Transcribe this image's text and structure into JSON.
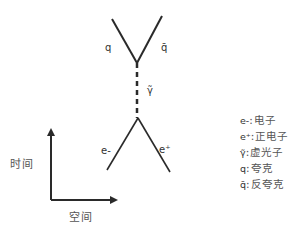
{
  "diagram": {
    "title": "",
    "particles": {
      "quark": "q",
      "antiquark": "q̄",
      "virtual_photon": "γ̃",
      "electron": "e-",
      "positron": "e⁺"
    },
    "axes": {
      "time_label": "时间",
      "space_label": "空间"
    },
    "legend": [
      {
        "symbol": "e-",
        "separator": ":",
        "description": "电子"
      },
      {
        "symbol": "e⁺",
        "separator": ":",
        "description": "正电子"
      },
      {
        "symbol": "γ̃",
        "separator": ":",
        "description": "虚光子"
      },
      {
        "symbol": "q",
        "separator": ":",
        "description": "夸克"
      },
      {
        "symbol": "q̄",
        "separator": ":",
        "description": "反夸克"
      }
    ],
    "colors": {
      "line": "#2a2a2a",
      "text": "#444444"
    }
  }
}
